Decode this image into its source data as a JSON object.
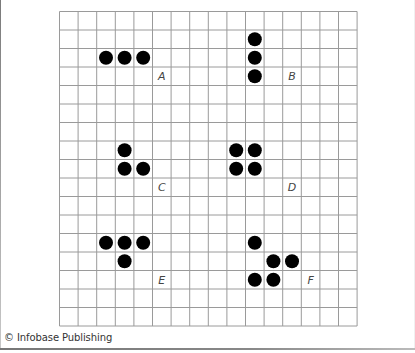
{
  "diagram": {
    "grid": {
      "columns": 16,
      "rows": 17,
      "cell_width": 18.6,
      "cell_height": 18.5,
      "line_color": "#9a9a9a",
      "dot_color": "#000000",
      "dot_radius": 7
    },
    "patterns": [
      {
        "label": "A",
        "label_cell": [
          5,
          3
        ],
        "cells": [
          [
            2,
            2
          ],
          [
            3,
            2
          ],
          [
            4,
            2
          ]
        ]
      },
      {
        "label": "B",
        "label_cell": [
          12,
          3
        ],
        "cells": [
          [
            10,
            1
          ],
          [
            10,
            2
          ],
          [
            10,
            3
          ]
        ]
      },
      {
        "label": "C",
        "label_cell": [
          5,
          9
        ],
        "cells": [
          [
            3,
            7
          ],
          [
            3,
            8
          ],
          [
            4,
            8
          ]
        ]
      },
      {
        "label": "D",
        "label_cell": [
          12,
          9
        ],
        "cells": [
          [
            9,
            7
          ],
          [
            10,
            7
          ],
          [
            9,
            8
          ],
          [
            10,
            8
          ]
        ]
      },
      {
        "label": "E",
        "label_cell": [
          5,
          14
        ],
        "cells": [
          [
            2,
            12
          ],
          [
            3,
            12
          ],
          [
            4,
            12
          ],
          [
            3,
            13
          ]
        ]
      },
      {
        "label": "F",
        "label_cell": [
          13,
          14
        ],
        "cells": [
          [
            10,
            12
          ],
          [
            11,
            13
          ],
          [
            12,
            13
          ],
          [
            10,
            14
          ],
          [
            11,
            14
          ]
        ]
      }
    ]
  },
  "footer": {
    "credit": "© Infobase Publishing"
  }
}
